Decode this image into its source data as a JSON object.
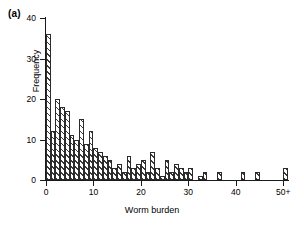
{
  "panel": {
    "label": "(a)"
  },
  "axes": {
    "ylabel": "Frequency",
    "xlabel": "Worm burden",
    "yticks": [
      0,
      10,
      20,
      30,
      40
    ],
    "ytick_labels": [
      "0",
      "10",
      "20",
      "30",
      "40"
    ],
    "xticks": [
      0,
      10,
      20,
      30,
      40,
      50
    ],
    "xtick_labels": [
      "0",
      "10",
      "20",
      "30",
      "40",
      "50+"
    ]
  },
  "style": {
    "bar_edge_color": "#2b2b2b",
    "bar_hatch_color": "#3a3a3a",
    "axis_color": "#1a1a1a",
    "background": "#ffffff"
  },
  "chart_data": {
    "type": "bar",
    "title": "",
    "xlabel": "Worm burden",
    "ylabel": "Frequency",
    "xlim": [
      0,
      51
    ],
    "ylim": [
      0,
      40
    ],
    "grid": false,
    "legend": null,
    "hatch": "diagonal-lines",
    "bin_width": 1,
    "categories": [
      0,
      1,
      2,
      3,
      4,
      5,
      6,
      7,
      8,
      9,
      10,
      11,
      12,
      13,
      14,
      15,
      16,
      17,
      18,
      19,
      20,
      21,
      22,
      23,
      24,
      25,
      26,
      27,
      28,
      29,
      30,
      31,
      32,
      33,
      34,
      35,
      36,
      37,
      38,
      39,
      40,
      41,
      42,
      43,
      44,
      45,
      46,
      47,
      48,
      49,
      50
    ],
    "values": [
      36,
      12,
      20,
      18,
      17,
      11,
      10,
      15,
      9,
      12,
      8,
      7,
      6,
      5,
      3,
      4,
      2,
      6,
      3,
      4,
      5,
      2,
      7,
      3,
      1,
      5,
      2,
      4,
      3,
      2,
      3,
      0,
      1,
      2,
      0,
      0,
      2,
      0,
      0,
      0,
      0,
      2,
      0,
      0,
      2,
      0,
      0,
      0,
      0,
      0,
      3
    ],
    "tick_label_override": {
      "50": "50+"
    }
  }
}
